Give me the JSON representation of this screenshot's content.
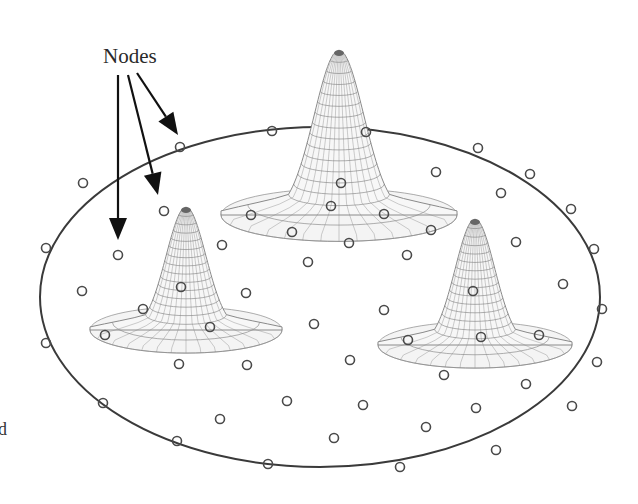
{
  "diagram": {
    "title_label": "Nodes",
    "cropped_fragment": "d",
    "colors": {
      "boundary": "#3a3a3a",
      "node": "#4a4a4a",
      "mesh": "#8a8a8a",
      "arrow": "#111111",
      "label": "#2a2a2a"
    },
    "boundary_ellipse": {
      "cx": 320,
      "cy": 297,
      "rx": 280,
      "ry": 170
    },
    "peaks": [
      {
        "name": "peak-large-back",
        "cx": 339,
        "base_y": 215,
        "apex_y": 50,
        "base_rx": 118,
        "base_ry": 48,
        "neck_rx": 45
      },
      {
        "name": "peak-left",
        "cx": 186,
        "base_y": 330,
        "apex_y": 207,
        "base_rx": 96,
        "base_ry": 42,
        "neck_rx": 36
      },
      {
        "name": "peak-right",
        "cx": 475,
        "base_y": 345,
        "apex_y": 219,
        "base_rx": 97,
        "base_ry": 42,
        "neck_rx": 36
      }
    ],
    "arrows": [
      {
        "from": [
          118,
          75
        ],
        "to": [
          118,
          240
        ]
      },
      {
        "from": [
          128,
          75
        ],
        "to": [
          158,
          195
        ]
      },
      {
        "from": [
          137,
          73
        ],
        "to": [
          178,
          135
        ]
      }
    ],
    "nodes_boundary": [
      [
        46,
        248
      ],
      [
        83,
        183
      ],
      [
        180,
        147
      ],
      [
        272,
        131
      ],
      [
        366,
        132
      ],
      [
        478,
        148
      ],
      [
        530,
        174
      ],
      [
        571,
        209
      ],
      [
        594,
        249
      ],
      [
        602,
        309
      ],
      [
        597,
        362
      ],
      [
        572,
        406
      ],
      [
        496,
        450
      ],
      [
        400,
        467
      ],
      [
        268,
        464
      ],
      [
        177,
        441
      ],
      [
        103,
        403
      ],
      [
        46,
        343
      ]
    ],
    "nodes_interior": [
      [
        164,
        211
      ],
      [
        118,
        255
      ],
      [
        82,
        291
      ],
      [
        222,
        245
      ],
      [
        246,
        293
      ],
      [
        314,
        324
      ],
      [
        350,
        360
      ],
      [
        384,
        310
      ],
      [
        287,
        401
      ],
      [
        363,
        405
      ],
      [
        220,
        419
      ],
      [
        334,
        438
      ],
      [
        426,
        427
      ],
      [
        476,
        408
      ],
      [
        308,
        262
      ],
      [
        436,
        172
      ],
      [
        501,
        193
      ],
      [
        516,
        242
      ],
      [
        563,
        284
      ],
      [
        407,
        255
      ],
      [
        349,
        243
      ],
      [
        292,
        232
      ],
      [
        251,
        215
      ],
      [
        384,
        214
      ],
      [
        431,
        230
      ],
      [
        341,
        183
      ],
      [
        331,
        206
      ],
      [
        181,
        287
      ],
      [
        143,
        309
      ],
      [
        210,
        327
      ],
      [
        105,
        335
      ],
      [
        179,
        364
      ],
      [
        247,
        365
      ],
      [
        473,
        291
      ],
      [
        481,
        337
      ],
      [
        539,
        335
      ],
      [
        408,
        340
      ],
      [
        444,
        375
      ],
      [
        526,
        384
      ]
    ]
  }
}
